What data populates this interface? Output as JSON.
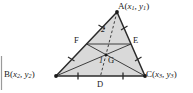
{
  "figure": {
    "type": "geometry-diagram",
    "colors": {
      "stroke": "#2b2b2b",
      "fill": "#d9d9d9",
      "text": "#1a1a1a",
      "background": "#ffffff",
      "edge_rule": "#9a9a9a"
    },
    "vertices": [
      {
        "name": "A",
        "label_letter": "A",
        "coord_x": "x",
        "coord_x_sub": "1",
        "coord_y": "y",
        "coord_y_sub": "1",
        "label_full": "A(x1, y1)",
        "px": 117,
        "py": 12
      },
      {
        "name": "B",
        "label_letter": "B",
        "coord_x": "x",
        "coord_x_sub": "2",
        "coord_y": "y",
        "coord_y_sub": "2",
        "label_full": "B(x2, y2)",
        "px": 56,
        "py": 76
      },
      {
        "name": "C",
        "label_letter": "C",
        "coord_x": "x",
        "coord_x_sub": "3",
        "coord_y": "y",
        "coord_y_sub": "3",
        "label_full": "C(x3, y3)",
        "px": 145,
        "py": 76
      }
    ],
    "midpoints": [
      {
        "name": "D",
        "label": "D",
        "on_side": "BC",
        "px": 100.5,
        "py": 76
      },
      {
        "name": "E",
        "label": "E",
        "on_side": "AC",
        "px": 131,
        "py": 44
      },
      {
        "name": "F",
        "label": "F",
        "on_side": "AB",
        "px": 86.5,
        "py": 44
      }
    ],
    "centroid": {
      "name": "G",
      "label": "G",
      "px": 106,
      "py": 55
    },
    "ratio_labels": [
      {
        "label": "2",
        "segment": "AG",
        "px": 103,
        "py": 30
      },
      {
        "label": "1",
        "segment": "GD",
        "px": 99,
        "py": 61
      }
    ],
    "tick_marks": {
      "BC": 2,
      "AB": 2,
      "AC": 2
    },
    "dashed_segment": "A-G-D"
  }
}
